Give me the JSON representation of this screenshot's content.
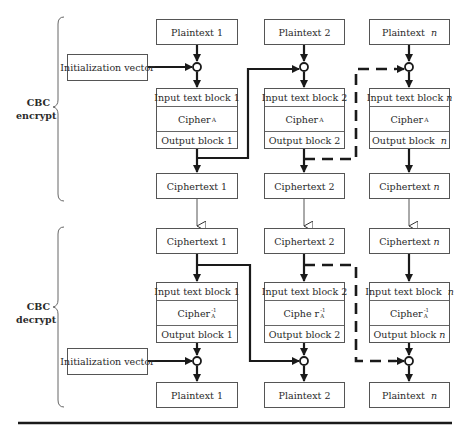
{
  "encrypt": {
    "section_label_line1": "CBC",
    "section_label_line2": "encrypt",
    "iv_label": "Initialization vector",
    "columns": [
      {
        "plaintext": "Plaintext  1",
        "input_block": "Input text block  1",
        "cipher": "Cipher",
        "cipher_sub": "A",
        "output_block": "Output block 1",
        "ciphertext": "Ciphertext  1"
      },
      {
        "plaintext": "Plaintext  2",
        "input_block": "Input text block  2",
        "cipher": "Cipher",
        "cipher_sub": "A",
        "output_block": "Output block 2",
        "ciphertext": "Ciphertext  2"
      },
      {
        "plaintext": "Plaintext  ",
        "plaintext_n": "n",
        "input_block": "Input text block ",
        "input_n": "n",
        "cipher": "Cipher",
        "cipher_sub": "A",
        "output_block": "Output block  ",
        "output_n": "n",
        "ciphertext": "Ciphertext ",
        "ciphertext_n": "n"
      }
    ]
  },
  "decrypt": {
    "section_label_line1": "CBC",
    "section_label_line2": "decrypt",
    "iv_label": "Initialization vector",
    "columns": [
      {
        "ciphertext": "Ciphertext  1",
        "input_block": "Input text block  1",
        "cipher": "Cipher",
        "cipher_sup": "-1",
        "cipher_sub": "A",
        "output_block": "Output block 1",
        "plaintext": "Plaintext  1"
      },
      {
        "ciphertext": "Ciphertext  2",
        "input_block": "Input text block 2",
        "cipher": "Ciphe r",
        "cipher_sup": "-1",
        "cipher_sub": "A",
        "output_block": "Output block 2",
        "plaintext": "Plaintext  2"
      },
      {
        "ciphertext": "Ciphertext ",
        "ciphertext_n": "n",
        "input_block": "Input text block  ",
        "input_n": "n",
        "cipher": "Cipher",
        "cipher_sup": "-1",
        "cipher_sub": "A",
        "output_block": "Output block ",
        "output_n": "n",
        "plaintext": "Plaintext  ",
        "plaintext_n": "n"
      }
    ]
  },
  "colors": {
    "line": "#1a1a1a",
    "box_border": "#555555",
    "text": "#2a2a2a"
  }
}
